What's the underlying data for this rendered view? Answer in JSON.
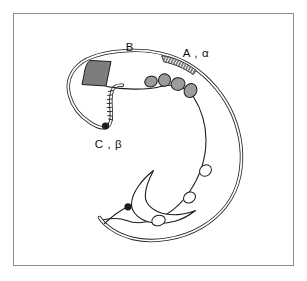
{
  "figure": {
    "labels": {
      "b": "B",
      "a_alpha": "A , α",
      "c_beta": "C , β"
    },
    "element_counts": {
      "gray_blobs": 4,
      "white_ovals": 3,
      "black_dots": 2,
      "hatched_bands": 2
    }
  },
  "colors": {
    "background": "#ffffff",
    "frame_border": "#8c8c8c",
    "line": "#1c1c1c",
    "triangle_fill": "#7d7d7d",
    "blob_fill": "#9c9c9c",
    "label_color": "#111111"
  }
}
